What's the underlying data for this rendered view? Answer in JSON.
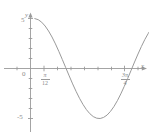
{
  "figure": {
    "caption_ghost": "",
    "background_color": "#ffffff",
    "line_color": "#9a9a9a",
    "axis_color": "#9a9a9a",
    "text_color": "#8a8a8a"
  },
  "axes": {
    "y_axis_name": "y",
    "x_axis_name": "x",
    "origin_label": "0",
    "y_tick_labels": [
      {
        "value": 5,
        "text": "5"
      },
      {
        "value": -5,
        "text": "-5"
      }
    ],
    "x_tick_labels": [
      {
        "numerator": "π",
        "denominator": "12",
        "text": "π/12"
      },
      {
        "numerator": "3π",
        "denominator": "4",
        "text": "3π/4"
      }
    ]
  },
  "chart_data": {
    "type": "line",
    "title": "",
    "xlabel": "x",
    "ylabel": "y",
    "xlim": [
      -0.35,
      3.05
    ],
    "ylim": [
      -6.2,
      6.2
    ],
    "grid": false,
    "legend": null,
    "series": [
      {
        "name": "y = 5 cos(2x - π/6)",
        "color": "#9a9a9a",
        "x": [
          0.1,
          0.18,
          0.26,
          0.34,
          0.42,
          0.5,
          0.58,
          0.66,
          0.74,
          0.82,
          0.9,
          0.98,
          1.06,
          1.14,
          1.22,
          1.3,
          1.38,
          1.46,
          1.54,
          1.62,
          1.7,
          1.78,
          1.86,
          1.94,
          2.02,
          2.1,
          2.18,
          2.26,
          2.34,
          2.42,
          2.5,
          2.58,
          2.66,
          2.74,
          2.82,
          2.9,
          2.98
        ],
        "y": [
          4.99,
          4.88,
          4.63,
          4.25,
          3.75,
          3.15,
          2.46,
          1.7,
          0.9,
          0.08,
          -0.74,
          -1.54,
          -2.29,
          -2.98,
          -3.59,
          -4.11,
          -4.52,
          -4.81,
          -4.97,
          -5.0,
          -4.89,
          -4.66,
          -4.29,
          -3.81,
          -3.22,
          -2.54,
          -1.79,
          -1.0,
          -0.18,
          0.65,
          1.45,
          2.21,
          2.91,
          3.52,
          4.05,
          4.46,
          4.77
        ]
      }
    ],
    "y_ticks": [
      -5,
      -4,
      -3,
      -2,
      -1,
      0,
      1,
      2,
      3,
      4,
      5
    ],
    "y_tick_labels_shown": [
      5,
      -5
    ],
    "x_ticks_labeled": [
      {
        "position": 0.2618,
        "label": "π/12"
      },
      {
        "position": 2.3562,
        "label": "3π/4"
      }
    ],
    "zero_crossings": [
      0.7854,
      2.3562
    ],
    "maximum": {
      "x": 0.0,
      "y": 5
    },
    "minimum": {
      "x": 1.5708,
      "y": -5
    },
    "amplitude": 5,
    "period": 3.14159
  }
}
